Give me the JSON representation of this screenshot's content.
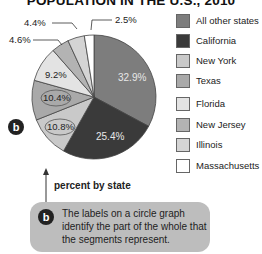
{
  "title": "POPULATION IN THE U.S., 2010",
  "chart_data": {
    "type": "pie",
    "title": "POPULATION IN THE U.S., 2010",
    "categories": [
      "All other states",
      "California",
      "Texas-label-10.8",
      "Texas",
      "New York-label-9.2",
      "Florida",
      "New Jersey",
      "Massachusetts"
    ],
    "slices": [
      {
        "label": "All other states",
        "value": 32.9,
        "color": "#7d7d7d",
        "text": "32.9%"
      },
      {
        "label": "California",
        "value": 25.4,
        "color": "#3a3a3a",
        "text": "25.4%"
      },
      {
        "label": "New York",
        "value": 10.8,
        "color": "#c9c9c9",
        "text": "10.8%"
      },
      {
        "label": "Texas",
        "value": 10.4,
        "color": "#a9a9a9",
        "text": "10.4%"
      },
      {
        "label": "Florida",
        "value": 9.2,
        "color": "#e3e3e3",
        "text": "9.2%"
      },
      {
        "label": "New Jersey",
        "value": 4.6,
        "color": "#b3b3b3",
        "text": "4.6%"
      },
      {
        "label": "Illinois",
        "value": 4.4,
        "color": "#d4d4d4",
        "text": "4.4%"
      },
      {
        "label": "Massachusetts",
        "value": 2.5,
        "color": "#ffffff",
        "text": "2.5%"
      }
    ],
    "legend": [
      "All other states",
      "California",
      "New York",
      "Texas",
      "Florida",
      "New Jersey",
      "Illinois",
      "Massachusetts"
    ],
    "legend_position": "right",
    "xlabel": "percent by state"
  },
  "legend": {
    "items": [
      {
        "label": "All other states",
        "color": "#7d7d7d"
      },
      {
        "label": "California",
        "color": "#3a3a3a"
      },
      {
        "label": "New York",
        "color": "#c9c9c9"
      },
      {
        "label": "Texas",
        "color": "#a9a9a9"
      },
      {
        "label": "Florida",
        "color": "#e3e3e3"
      },
      {
        "label": "New Jersey",
        "color": "#b3b3b3"
      },
      {
        "label": "Illinois",
        "color": "#d4d4d4"
      },
      {
        "label": "Massachusetts",
        "color": "#ffffff"
      }
    ]
  },
  "labels": {
    "all_other": "32.9%",
    "california": "25.4%",
    "new_york": "10.8%",
    "texas": "10.4%",
    "florida": "9.2%",
    "new_jersey": "4.6%",
    "illinois": "4.4%",
    "massachusetts": "2.5%"
  },
  "axis_note": "percent by state",
  "badge_letter": "b",
  "callout": {
    "text": "The labels on a circle graph identify the part of the whole that the segments represent."
  }
}
